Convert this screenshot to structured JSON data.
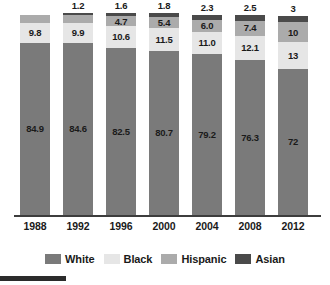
{
  "chart_data": {
    "type": "bar",
    "subtype": "stacked-bar-100",
    "title": "",
    "xlabel": "",
    "ylabel": "",
    "ylim": [
      0,
      100
    ],
    "grid": false,
    "legend_position": "bottom",
    "categories": [
      "1988",
      "1992",
      "1996",
      "2000",
      "2004",
      "2008",
      "2012"
    ],
    "series": [
      {
        "name": "White",
        "color": "#7a7a7a",
        "values": [
          84.9,
          84.6,
          82.5,
          80.7,
          79.2,
          76.3,
          72
        ]
      },
      {
        "name": "Black",
        "color": "#e6e6e6",
        "values": [
          9.8,
          9.9,
          10.6,
          11.5,
          11.0,
          12.1,
          13
        ]
      },
      {
        "name": "Hispanic",
        "color": "#ababab",
        "values": [
          3.6,
          3.8,
          4.7,
          5.4,
          6.0,
          7.4,
          10
        ]
      },
      {
        "name": "Asian",
        "color": "#4a4a4a",
        "values": [
          null,
          1.2,
          1.6,
          1.8,
          2.3,
          2.5,
          3
        ]
      }
    ],
    "data_labels": {
      "White": [
        "84.9",
        "84.6",
        "82.5",
        "80.7",
        "79.2",
        "76.3",
        "72"
      ],
      "Black": [
        "9.8",
        "9.9",
        "10.6",
        "11.5",
        "11.0",
        "12.1",
        "13"
      ],
      "Hispanic": [
        "3.6",
        "3.8",
        "4.7",
        "5.4",
        "6.0",
        "7.4",
        "10"
      ],
      "Asian": [
        "",
        "1.2",
        "1.6",
        "1.8",
        "2.3",
        "2.5",
        "3"
      ]
    }
  },
  "legend": {
    "items": [
      {
        "label": "White",
        "color": "#7a7a7a"
      },
      {
        "label": "Black",
        "color": "#e6e6e6"
      },
      {
        "label": "Hispanic",
        "color": "#ababab"
      },
      {
        "label": "Asian",
        "color": "#4a4a4a"
      }
    ]
  },
  "axis": {
    "x_ticks": [
      "1988",
      "1992",
      "1996",
      "2000",
      "2004",
      "2008",
      "2012"
    ]
  }
}
